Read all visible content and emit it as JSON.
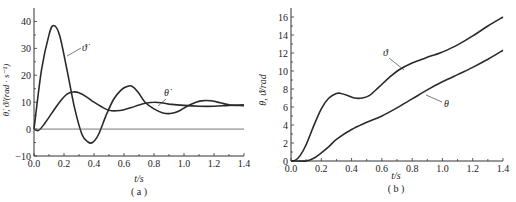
{
  "chart_data": [
    {
      "type": "line",
      "panel": "(a)",
      "xlabel": "t/s",
      "ylabel": "θ̇, ϑ̇/(rad · s⁻¹)",
      "xlim": [
        0,
        1.4
      ],
      "ylim": [
        -10,
        45
      ],
      "xticks": [
        "0.0",
        "0.2",
        "0.4",
        "0.6",
        "0.8",
        "1.0",
        "1.2",
        "1.4"
      ],
      "yticks": [
        "-10",
        "0",
        "10",
        "20",
        "30",
        "40"
      ],
      "grid": false,
      "series": [
        {
          "name": "ϑ̇",
          "x": [
            0,
            0.05,
            0.1,
            0.13,
            0.17,
            0.22,
            0.27,
            0.32,
            0.36,
            0.39,
            0.43,
            0.48,
            0.53,
            0.58,
            0.62,
            0.65,
            0.69,
            0.74,
            0.8,
            0.86,
            0.91,
            0.96,
            1.02,
            1.08,
            1.13,
            1.18,
            1.24,
            1.3,
            1.35,
            1.4
          ],
          "values": [
            0,
            22,
            35,
            38.5,
            35,
            22,
            8,
            -2,
            -4.8,
            -5,
            -2,
            5,
            11,
            14.5,
            15.8,
            16,
            14,
            10,
            7.5,
            6,
            5.8,
            6.5,
            8.5,
            10,
            10.6,
            10.5,
            9.8,
            9,
            8.8,
            8.7
          ]
        },
        {
          "name": "θ̇",
          "x": [
            0,
            0.03,
            0.07,
            0.12,
            0.17,
            0.22,
            0.26,
            0.3,
            0.35,
            0.4,
            0.45,
            0.5,
            0.55,
            0.6,
            0.65,
            0.7,
            0.75,
            0.8,
            0.85,
            0.9,
            1.0,
            1.1,
            1.2,
            1.3,
            1.4
          ],
          "values": [
            0,
            -0.5,
            2,
            6,
            10,
            13,
            13.8,
            13.5,
            12,
            10,
            8.3,
            7,
            6.8,
            7.2,
            8,
            9,
            9.7,
            10,
            9.8,
            9.3,
            8.8,
            8.5,
            8.5,
            8.8,
            9
          ]
        },
        {
          "name": "zero-line",
          "x": [
            0,
            1.4
          ],
          "values": [
            0,
            0
          ]
        }
      ],
      "annotations": [
        {
          "text": "ϑ̇",
          "at": [
            0.27,
            31
          ]
        },
        {
          "text": "θ̇",
          "at": [
            0.83,
            12
          ]
        }
      ]
    },
    {
      "type": "line",
      "panel": "(b)",
      "xlabel": "t/s",
      "ylabel": "θ, ϑ/rad",
      "xlim": [
        0,
        1.4
      ],
      "ylim": [
        0,
        17
      ],
      "xticks": [
        "0.0",
        "0.2",
        "0.4",
        "0.6",
        "0.8",
        "1.0",
        "1.2",
        "1.4"
      ],
      "yticks": [
        "0",
        "2",
        "4",
        "6",
        "8",
        "10",
        "12",
        "14",
        "16"
      ],
      "grid": false,
      "series": [
        {
          "name": "ϑ",
          "x": [
            0,
            0.03,
            0.06,
            0.1,
            0.15,
            0.2,
            0.25,
            0.3,
            0.33,
            0.37,
            0.42,
            0.47,
            0.52,
            0.58,
            0.65,
            0.72,
            0.8,
            0.88,
            0.95,
            1.0,
            1.1,
            1.2,
            1.3,
            1.4
          ],
          "values": [
            0,
            0.1,
            0.6,
            1.8,
            3.9,
            5.8,
            7.0,
            7.5,
            7.5,
            7.3,
            7.0,
            7.0,
            7.3,
            8.2,
            9.3,
            10.2,
            10.9,
            11.4,
            11.8,
            12.1,
            12.9,
            13.9,
            15.0,
            16.0
          ]
        },
        {
          "name": "θ",
          "x": [
            0,
            0.05,
            0.1,
            0.15,
            0.2,
            0.25,
            0.3,
            0.4,
            0.5,
            0.6,
            0.7,
            0.8,
            0.9,
            1.0,
            1.1,
            1.2,
            1.3,
            1.4
          ],
          "values": [
            0,
            0,
            0,
            0.3,
            0.9,
            1.6,
            2.4,
            3.5,
            4.3,
            5.0,
            5.9,
            6.9,
            7.9,
            8.8,
            9.6,
            10.4,
            11.3,
            12.3
          ]
        }
      ],
      "annotations": [
        {
          "text": "ϑ",
          "at": [
            0.58,
            11.4
          ]
        },
        {
          "text": "θ",
          "at": [
            0.99,
            6.0
          ]
        }
      ]
    }
  ],
  "captions": {
    "a": "( a )",
    "b": "( b )"
  },
  "labels": {
    "a_xlabel": "t/s",
    "a_ylabel": "θ̇, ϑ̇/(rad · s⁻¹)",
    "b_xlabel": "t/s",
    "b_ylabel": "θ, ϑ/rad",
    "a_ann1": "ϑ̇",
    "a_ann2": "θ̇",
    "b_ann1": "ϑ",
    "b_ann2": "θ"
  }
}
